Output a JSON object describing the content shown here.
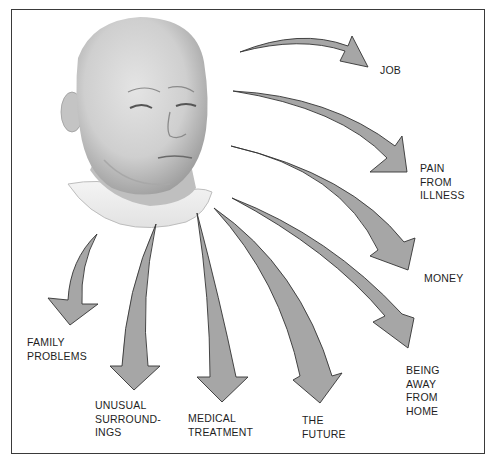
{
  "diagram": {
    "style": {
      "arrow_fill": "#a6a6a6",
      "arrow_stroke": "#333333",
      "border_color": "#3a3a3a",
      "text_color": "#1e1e1e"
    },
    "sources_of_stress": [
      {
        "id": "job",
        "label": "JOB"
      },
      {
        "id": "pain",
        "label": "PAIN\nFROM\nILLNESS"
      },
      {
        "id": "money",
        "label": "MONEY"
      },
      {
        "id": "home",
        "label": "BEING\nAWAY\nFROM\nHOME"
      },
      {
        "id": "future",
        "label": "THE\nFUTURE"
      },
      {
        "id": "medical",
        "label": "MEDICAL\nTREATMENT"
      },
      {
        "id": "surroundings",
        "label": "UNUSUAL\nSURROUND-\nINGS"
      },
      {
        "id": "family",
        "label": "FAMILY\nPROBLEMS"
      }
    ]
  }
}
